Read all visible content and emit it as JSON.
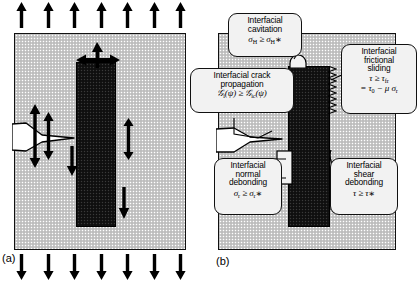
{
  "figure": {
    "panels": [
      {
        "id": "a",
        "caption": "(a)",
        "description": "Composite block under remote tension with fiber, matrix crack and local stress arrows"
      },
      {
        "id": "b",
        "caption": "(b)",
        "description": "Same geometry annotated with five interfacial failure criteria"
      }
    ]
  },
  "panel_a": {
    "caption": "(a)",
    "top_arrows": {
      "count": 7,
      "direction": "up",
      "name": "remote-tension-arrows-top"
    },
    "bottom_arrows": {
      "count": 7,
      "direction": "down",
      "name": "remote-tension-arrows-bottom"
    },
    "matrix_label": "matrix",
    "fiber_label": "fiber",
    "crack_label": "matrix crack",
    "internal_arrows": [
      {
        "name": "fiber-tip-opening-arrows",
        "type": "cross"
      },
      {
        "name": "crack-tip-opening-arrows",
        "type": "double-vertical"
      },
      {
        "name": "interface-normal-arrows",
        "type": "double-vertical"
      },
      {
        "name": "interface-shear-arrow-left",
        "type": "down"
      },
      {
        "name": "interface-shear-arrow-right",
        "type": "down"
      }
    ]
  },
  "panel_b": {
    "caption": "(b)",
    "callouts": [
      {
        "id": "cavitation",
        "name": "callout-interfacial-cavitation",
        "lines": [
          "Interfacial",
          "cavitation"
        ],
        "equation_html": "σ<sub>H</sub> ≥ σ<sub>H</sub> *",
        "equation_text": "σ_H ≥ σ_H*"
      },
      {
        "id": "crack-propagation",
        "name": "callout-interfacial-crack-propagation",
        "lines": [
          "Interfacial crack",
          "propagation"
        ],
        "equation_html": "𝒢<sub>i</sub>(ψ) ≥ 𝒢<sub>ic</sub>(ψ)",
        "equation_text": "G_i(ψ) ≥ G_ic(ψ)"
      },
      {
        "id": "frictional-sliding",
        "name": "callout-interfacial-frictional-sliding",
        "lines": [
          "Interfacial",
          "frictional",
          "sliding"
        ],
        "equation_html": "τ ≥ τ<sub>fr</sub>",
        "equation2_html": "= τ<sub>0</sub> − μ σ<sub>r</sub>",
        "equation_text": "τ ≥ τ_fr = τ_0 − μ σ_r"
      },
      {
        "id": "normal-debonding",
        "name": "callout-interfacial-normal-debonding",
        "lines": [
          "Interfacial",
          "normal",
          "debonding"
        ],
        "equation_html": "σ<sub>r</sub> ≥ σ<sub>r</sub> *",
        "equation_text": "σ_r ≥ σ_r*"
      },
      {
        "id": "shear-debonding",
        "name": "callout-interfacial-shear-debonding",
        "lines": [
          "Interfacial",
          "shear",
          "debonding"
        ],
        "equation_html": "τ ≥ τ *",
        "equation_text": "τ ≥ τ*"
      }
    ]
  },
  "colors": {
    "matrix_grey": "#c9c9c9",
    "fiber_dark": "#141414",
    "callout_fill": "#f2f2f2",
    "stroke": "#111111",
    "background": "#ffffff"
  }
}
